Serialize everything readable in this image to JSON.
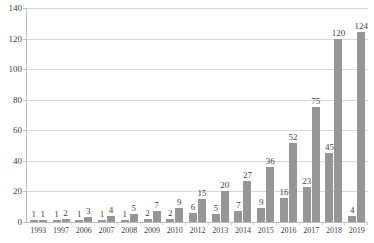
{
  "chart_data": {
    "type": "bar",
    "title": "",
    "subtitle": "",
    "xlabel": "",
    "ylabel": "",
    "ylim": [
      0,
      140
    ],
    "ytick_step": 20,
    "yticks": [
      0,
      20,
      40,
      60,
      80,
      100,
      120,
      140
    ],
    "grid": true,
    "legend": "none",
    "bar_color": "#969696",
    "categories": [
      "1993",
      "1997",
      "2006",
      "2007",
      "2008",
      "2009",
      "2010",
      "2012",
      "2013",
      "2014",
      "2015",
      "2016",
      "2017",
      "2018",
      "2019"
    ],
    "series": [
      {
        "name": "series-1",
        "values": [
          1,
          1,
          1,
          1,
          1,
          2,
          2,
          6,
          5,
          7,
          9,
          16,
          23,
          45,
          4
        ]
      },
      {
        "name": "series-2",
        "values": [
          1,
          2,
          3,
          4,
          5,
          7,
          9,
          15,
          20,
          27,
          36,
          52,
          75,
          120,
          124
        ]
      }
    ]
  }
}
